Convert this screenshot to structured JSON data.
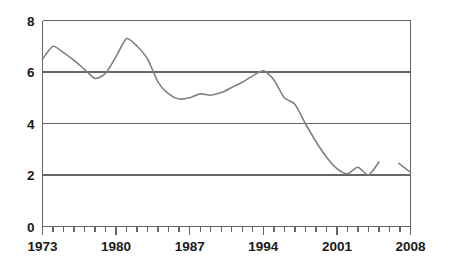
{
  "chart_data": {
    "type": "line",
    "title": "",
    "subtitle": "",
    "xlabel": "",
    "ylabel": "",
    "xlim": [
      1973,
      2008
    ],
    "ylim": [
      0,
      8
    ],
    "grid": true,
    "grid_axis": "y",
    "legend": false,
    "legend_position": "none",
    "line_color": "#808080",
    "axis_color": "#666666",
    "text_color": "#1a1a1a",
    "background_color": "#ffffff",
    "x_tick_values": [
      1973,
      1974,
      1975,
      1976,
      1977,
      1978,
      1979,
      1980,
      1981,
      1982,
      1983,
      1984,
      1985,
      1986,
      1987,
      1988,
      1989,
      1990,
      1991,
      1992,
      1993,
      1994,
      1995,
      1996,
      1997,
      1998,
      1999,
      2000,
      2001,
      2002,
      2003,
      2004,
      2005,
      2006,
      2007,
      2008
    ],
    "x_tick_labels": [
      "1973",
      "1980",
      "1987",
      "1994",
      "2001",
      "2008"
    ],
    "x_labeled_values": [
      1973,
      1980,
      1987,
      1994,
      2001,
      2008
    ],
    "y_tick_labels": [
      "0",
      "2",
      "4",
      "6",
      "8"
    ],
    "y_tick_values": [
      0,
      2,
      4,
      6,
      8
    ],
    "x": [
      1973,
      1974,
      1975,
      1976,
      1977,
      1978,
      1979,
      1980,
      1981,
      1982,
      1983,
      1984,
      1985,
      1986,
      1987,
      1988,
      1989,
      1990,
      1991,
      1992,
      1993,
      1994,
      1995,
      1996,
      1997,
      1998,
      1999,
      2000,
      2001,
      2002,
      2003,
      2004,
      2005
    ],
    "values": [
      6.5,
      7.0,
      6.75,
      6.45,
      6.1,
      5.75,
      5.95,
      6.6,
      7.3,
      7.0,
      6.5,
      5.6,
      5.15,
      4.95,
      5.0,
      5.15,
      5.1,
      5.2,
      5.4,
      5.6,
      5.85,
      6.05,
      5.7,
      5.0,
      4.75,
      4.0,
      3.3,
      2.7,
      2.25,
      2.05,
      2.3,
      2.0,
      2.5
    ],
    "segments": [
      {
        "name": "main-series",
        "x": [
          1973,
          1974,
          1975,
          1976,
          1977,
          1978,
          1979,
          1980,
          1981,
          1982,
          1983,
          1984,
          1985,
          1986,
          1987,
          1988,
          1989,
          1990,
          1991,
          1992,
          1993,
          1994,
          1995,
          1996,
          1997,
          1998,
          1999,
          2000,
          2001,
          2002,
          2003,
          2004,
          2005
        ],
        "values": [
          6.5,
          7.0,
          6.75,
          6.45,
          6.1,
          5.75,
          5.95,
          6.6,
          7.3,
          7.0,
          6.5,
          5.6,
          5.15,
          4.95,
          5.0,
          5.15,
          5.1,
          5.2,
          5.4,
          5.6,
          5.85,
          6.05,
          5.7,
          5.0,
          4.75,
          4.0,
          3.3,
          2.7,
          2.25,
          2.05,
          2.3,
          2.0,
          2.5
        ]
      },
      {
        "name": "trailing-series",
        "x": [
          2006.9,
          2008
        ],
        "values": [
          2.45,
          2.1
        ]
      }
    ],
    "annotations": [
      {
        "label": "break-in-line",
        "between": [
          2005,
          2007
        ]
      }
    ]
  }
}
